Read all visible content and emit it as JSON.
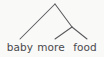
{
  "figure": {
    "kind": "syntax-tree-diagram",
    "width": 104,
    "height": 57,
    "background_color": "#f9f9f8",
    "line_color": "#59595c",
    "text_color": "#4a4a4d"
  },
  "tree": {
    "root": {
      "name": "root-node",
      "label": "",
      "x": 55,
      "y": 4
    },
    "internal_nodes": [
      {
        "name": "right-internal-node",
        "label": "",
        "x": 72,
        "y": 27
      }
    ],
    "leaves": [
      {
        "name": "leaf-baby",
        "label": "baby",
        "x": 20,
        "y": 41,
        "attach_x": 20,
        "attach_y": 39
      },
      {
        "name": "leaf-more",
        "label": "more",
        "x": 51,
        "y": 41,
        "attach_x": 55,
        "attach_y": 39
      },
      {
        "name": "leaf-food",
        "label": "food",
        "x": 85,
        "y": 41,
        "attach_x": 87,
        "attach_y": 39
      }
    ],
    "branches": [
      {
        "name": "branch-root-to-baby",
        "x1": 55,
        "y1": 4,
        "x2": 20,
        "y2": 39
      },
      {
        "name": "branch-root-to-internal",
        "x1": 55,
        "y1": 4,
        "x2": 72,
        "y2": 27
      },
      {
        "name": "branch-internal-to-more",
        "x1": 72,
        "y1": 27,
        "x2": 55,
        "y2": 39
      },
      {
        "name": "branch-internal-to-food",
        "x1": 72,
        "y1": 27,
        "x2": 87,
        "y2": 39
      }
    ]
  }
}
